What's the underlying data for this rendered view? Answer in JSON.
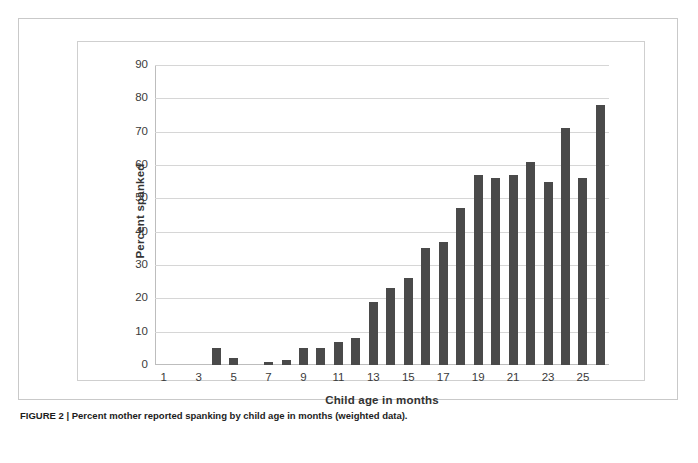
{
  "figure": {
    "caption_label": "FIGURE 2",
    "caption_separator": "|",
    "caption_text": "Percent mother reported spanking by child age in months (weighted data).",
    "caption_full": "FIGURE 2 | Percent mother reported spanking by child age in months (weighted data)."
  },
  "colors": {
    "bar": "#4a4a4a",
    "gridline": "#d6d6d6",
    "axis": "#bdbdbd",
    "frame": "#cfcfcf",
    "outer_box": "#c9c9c9",
    "text": "#333333",
    "background": "#ffffff"
  },
  "chart_data": {
    "type": "bar",
    "title": "",
    "xlabel": "Child age in months",
    "ylabel": "Percent spanked",
    "ylim": [
      0,
      90
    ],
    "ytick_values": [
      0,
      10,
      20,
      30,
      40,
      50,
      60,
      70,
      80,
      90
    ],
    "ytick_labels": [
      "0",
      "10",
      "20",
      "30",
      "40",
      "50",
      "60",
      "70",
      "80",
      "90"
    ],
    "grid": "horizontal",
    "legend": "none",
    "categories": [
      1,
      2,
      3,
      4,
      5,
      6,
      7,
      8,
      9,
      10,
      11,
      12,
      13,
      14,
      15,
      16,
      17,
      18,
      19,
      20,
      21,
      22,
      23,
      24,
      25,
      26
    ],
    "xtick_labels_shown": [
      "1",
      "",
      "3",
      "",
      "5",
      "",
      "7",
      "",
      "9",
      "",
      "11",
      "",
      "13",
      "",
      "15",
      "",
      "17",
      "",
      "19",
      "",
      "21",
      "",
      "23",
      "",
      "25",
      ""
    ],
    "values": [
      0,
      0,
      0,
      5,
      2,
      0,
      1,
      1.5,
      5,
      5,
      7,
      8,
      19,
      23,
      26,
      35,
      37,
      47,
      57,
      56,
      57,
      61,
      55,
      71,
      56,
      78
    ],
    "series": [
      {
        "name": "Percent spanked",
        "values": [
          0,
          0,
          0,
          5,
          2,
          0,
          1,
          1.5,
          5,
          5,
          7,
          8,
          19,
          23,
          26,
          35,
          37,
          47,
          57,
          56,
          57,
          61,
          55,
          71,
          56,
          78
        ]
      }
    ]
  }
}
